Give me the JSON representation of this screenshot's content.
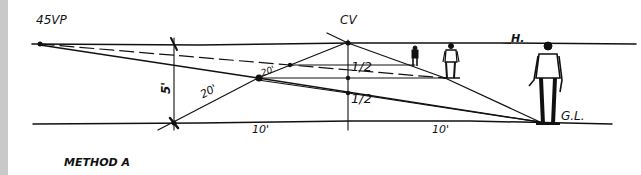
{
  "diagram": {
    "title": "METHOD A",
    "labels": {
      "vanishing_point": "45VP",
      "center_of_vision": "CV",
      "horizon": "H.",
      "ground_line": "G.L.",
      "height_5ft": "5'",
      "dist_20ft_a": "20'",
      "dist_20ft_b": "20'",
      "half_upper": "1/2",
      "half_lower": "1/2",
      "dist_10ft_left": "10'",
      "dist_10ft_right": "10'"
    },
    "figures": [
      {
        "name": "far-figure",
        "description": "small distant person"
      },
      {
        "name": "mid-figure",
        "description": "medium person"
      },
      {
        "name": "near-figure",
        "description": "large foreground person"
      }
    ],
    "colors": {
      "ink": "#111111",
      "paper": "#ffffff",
      "margin": "#c9c9c9"
    }
  }
}
